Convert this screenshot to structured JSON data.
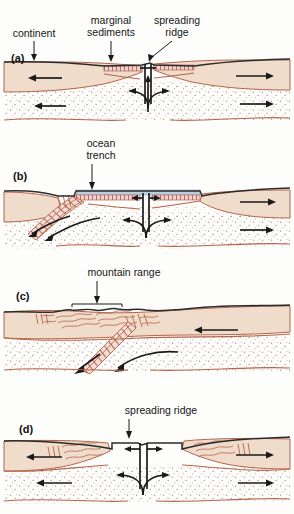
{
  "figure": {
    "panels": [
      {
        "id": "a",
        "panel_label": "(a)",
        "stage": "continental rifting with young ocean basin",
        "labels": [
          {
            "name": "continent",
            "text": "continent",
            "line1": "continent",
            "line2": ""
          },
          {
            "name": "marginal-sediments",
            "text": "marginal sediments",
            "line1": "marginal",
            "line2": "sediments"
          },
          {
            "name": "spreading-ridge",
            "text": "spreading ridge",
            "line1": "spreading",
            "line2": "ridge"
          }
        ]
      },
      {
        "id": "b",
        "panel_label": "(b)",
        "stage": "subduction beneath continental margin",
        "labels": [
          {
            "name": "ocean-trench",
            "text": "ocean trench",
            "line1": "ocean",
            "line2": "trench"
          }
        ]
      },
      {
        "id": "c",
        "panel_label": "(c)",
        "stage": "continental collision forming mountains",
        "labels": [
          {
            "name": "mountain-range",
            "text": "mountain range",
            "line1": "mountain range",
            "line2": ""
          }
        ]
      },
      {
        "id": "d",
        "panel_label": "(d)",
        "stage": "renewed rifting of collided continents",
        "labels": [
          {
            "name": "spreading-ridge",
            "text": "spreading ridge",
            "line1": "spreading ridge",
            "line2": ""
          }
        ]
      }
    ]
  },
  "colors": {
    "continental_crust": "#efdccb",
    "mantle_stipple": "#b5654a",
    "moho_line": "#b5654a",
    "surface_line": "#2b2b2b",
    "ocean_water": "#b9cfe0",
    "oceanic_crust": "#c98a9a",
    "arrow": "#1a1a1a",
    "background": "#fdfdfc",
    "text": "#151515"
  }
}
